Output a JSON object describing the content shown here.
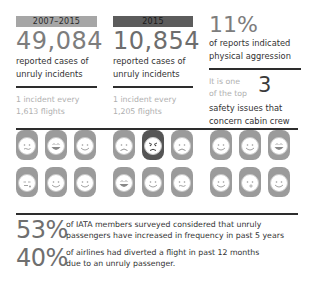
{
  "columns": [
    {
      "period": "2007–2015",
      "count": "49,084",
      "desc_line1": "reported cases of",
      "desc_line2": "unruly incidents",
      "rate_line1": "1 incident every",
      "rate_line2": "1,613 flights"
    },
    {
      "period": "2015",
      "count": "10,854",
      "desc_line1": "reported cases of",
      "desc_line2": "unruly incidents",
      "rate_line1": "1 incident every",
      "rate_line2": "1,205 flights"
    }
  ],
  "aggression": {
    "percent": "11%",
    "desc_line1": "of reports indicated",
    "desc_line2": "physical aggression"
  },
  "top_issues": {
    "lead_line1": "It is one",
    "lead_line2": "of the top",
    "number": "3",
    "desc_line1": "safety issues that",
    "desc_line2": "concern cabin crew"
  },
  "faces": {
    "groups": [
      [
        "smirk",
        "laugh",
        "smile",
        "wink",
        "smile",
        "smile"
      ],
      [
        "sad",
        "angry",
        "sad",
        "laugh",
        "smile",
        "smirk"
      ],
      [
        "smile",
        "smile",
        "laugh",
        "smile",
        "kiss",
        "smile"
      ]
    ],
    "angry_highlight": [
      1,
      1
    ],
    "colors": {
      "base": "#9b9b9b",
      "angry": "#555555"
    }
  },
  "stats": [
    {
      "percent": "53%",
      "line1": "of IATA members surveyed considered that unruly",
      "line2": "passengers have increased in frequency in past 5 years"
    },
    {
      "percent": "40%",
      "line1": "of airlines had diverted a flight in past 12 months",
      "line2": "due to an unruly passenger."
    }
  ]
}
